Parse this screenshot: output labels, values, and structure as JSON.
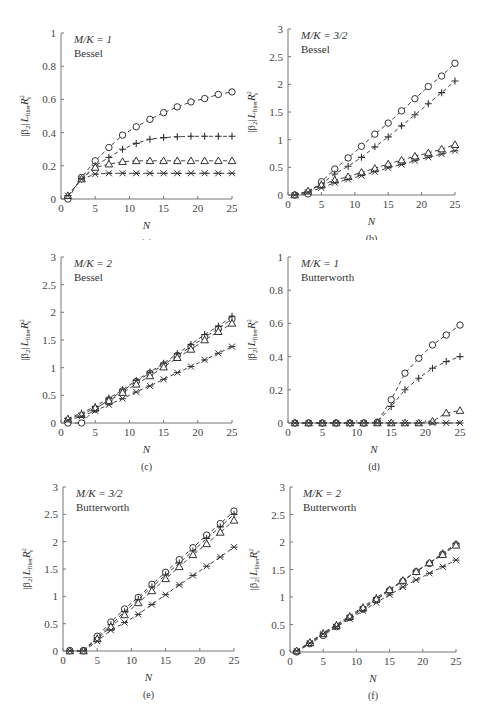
{
  "figure": {
    "ylabel": "|β2| L_fiber R_s^2",
    "xlabel": "N",
    "x_ticks": [
      0,
      5,
      10,
      15,
      20,
      25
    ],
    "series_markers": [
      "circle",
      "plus",
      "triangle",
      "star-x"
    ]
  },
  "chart_data": [
    {
      "id": "a",
      "caption": "(a)",
      "type": "line",
      "title": "M/K = 1",
      "subtitle": "Bessel",
      "xlabel": "N",
      "ylabel": "|β2| L_fiber R_s^2",
      "xlim": [
        0,
        25
      ],
      "ylim": [
        0,
        1
      ],
      "y_ticks": [
        "0",
        "0.2",
        "0.4",
        "0.6",
        "0.8",
        "1"
      ],
      "y_tick_values": [
        0,
        0.2,
        0.4,
        0.6,
        0.8,
        1
      ],
      "grid": false,
      "x": [
        1,
        3,
        5,
        7,
        9,
        11,
        13,
        15,
        17,
        19,
        21,
        23,
        25
      ],
      "series": [
        {
          "name": "circle",
          "marker": "circle",
          "values": [
            0.0,
            0.13,
            0.23,
            0.31,
            0.385,
            0.435,
            0.48,
            0.52,
            0.555,
            0.585,
            0.605,
            0.63,
            0.645
          ]
        },
        {
          "name": "plus",
          "marker": "plus",
          "values": [
            0.02,
            0.12,
            0.2,
            0.25,
            0.3,
            0.335,
            0.36,
            0.37,
            0.375,
            0.378,
            0.378,
            0.378,
            0.378
          ]
        },
        {
          "name": "triangle",
          "marker": "triangle",
          "values": [
            0.02,
            0.12,
            0.19,
            0.21,
            0.225,
            0.23,
            0.23,
            0.23,
            0.23,
            0.23,
            0.23,
            0.23,
            0.23
          ]
        },
        {
          "name": "star",
          "marker": "star",
          "values": [
            0.02,
            0.12,
            0.15,
            0.155,
            0.155,
            0.155,
            0.155,
            0.155,
            0.155,
            0.155,
            0.155,
            0.155,
            0.155
          ]
        }
      ]
    },
    {
      "id": "b",
      "caption": "(b)",
      "type": "line",
      "title": "M/K = 3/2",
      "subtitle": "Bessel",
      "xlabel": "N",
      "ylabel": "|β2| L_fiber R_s^2",
      "xlim": [
        0,
        25
      ],
      "ylim": [
        0,
        3
      ],
      "y_ticks": [
        "0",
        "0.5",
        "1",
        "1.5",
        "2",
        "2.5",
        "3"
      ],
      "y_tick_values": [
        0,
        0.5,
        1,
        1.5,
        2,
        2.5,
        3
      ],
      "grid": false,
      "x": [
        1,
        3,
        5,
        7,
        9,
        11,
        13,
        15,
        17,
        19,
        21,
        23,
        25
      ],
      "series": [
        {
          "name": "circle",
          "marker": "circle",
          "values": [
            0.0,
            0.02,
            0.24,
            0.47,
            0.67,
            0.88,
            1.1,
            1.3,
            1.52,
            1.74,
            1.96,
            2.15,
            2.38
          ]
        },
        {
          "name": "plus",
          "marker": "plus",
          "values": [
            0.0,
            0.07,
            0.2,
            0.38,
            0.52,
            0.68,
            0.87,
            1.05,
            1.25,
            1.45,
            1.65,
            1.85,
            2.06
          ]
        },
        {
          "name": "triangle",
          "marker": "triangle",
          "values": [
            0.0,
            0.07,
            0.18,
            0.27,
            0.33,
            0.41,
            0.48,
            0.56,
            0.63,
            0.7,
            0.76,
            0.83,
            0.91
          ]
        },
        {
          "name": "star",
          "marker": "star",
          "values": [
            0.0,
            0.05,
            0.13,
            0.22,
            0.28,
            0.35,
            0.42,
            0.49,
            0.55,
            0.62,
            0.68,
            0.74,
            0.8
          ]
        }
      ]
    },
    {
      "id": "c",
      "caption": "(c)",
      "type": "line",
      "title": "M/K = 2",
      "subtitle": "Bessel",
      "xlabel": "N",
      "ylabel": "|β2| L_fiber R_s^2",
      "xlim": [
        0,
        25
      ],
      "ylim": [
        0,
        3
      ],
      "y_ticks": [
        "0",
        "0.5",
        "1",
        "1.5",
        "2",
        "2.5",
        "3"
      ],
      "y_tick_values": [
        0,
        0.5,
        1,
        1.5,
        2,
        2.5,
        3
      ],
      "grid": false,
      "x": [
        1,
        3,
        5,
        7,
        9,
        11,
        13,
        15,
        17,
        19,
        21,
        23,
        25
      ],
      "series": [
        {
          "name": "circle",
          "marker": "circle",
          "values": [
            0.0,
            0.0,
            0.25,
            0.42,
            0.58,
            0.75,
            0.9,
            1.05,
            1.22,
            1.38,
            1.55,
            1.7,
            1.88
          ]
        },
        {
          "name": "plus",
          "marker": "plus",
          "values": [
            0.08,
            0.18,
            0.3,
            0.45,
            0.6,
            0.77,
            0.92,
            1.08,
            1.25,
            1.42,
            1.6,
            1.75,
            1.93
          ]
        },
        {
          "name": "triangle",
          "marker": "triangle",
          "values": [
            0.07,
            0.15,
            0.27,
            0.4,
            0.55,
            0.7,
            0.85,
            1.01,
            1.18,
            1.33,
            1.5,
            1.65,
            1.8
          ]
        },
        {
          "name": "star",
          "marker": "star",
          "values": [
            0.05,
            0.12,
            0.22,
            0.33,
            0.44,
            0.56,
            0.67,
            0.79,
            0.91,
            1.02,
            1.14,
            1.26,
            1.38
          ]
        }
      ]
    },
    {
      "id": "d",
      "caption": "(d)",
      "type": "line",
      "title": "M/K = 1",
      "subtitle": "Butterworth",
      "xlabel": "N",
      "ylabel": "|β2| L_fiber R_s^2",
      "xlim": [
        0,
        25
      ],
      "ylim": [
        0,
        1
      ],
      "y_ticks": [
        "0",
        "0.2",
        "0.4",
        "0.6",
        "0.8",
        "1"
      ],
      "y_tick_values": [
        0,
        0.2,
        0.4,
        0.6,
        0.8,
        1
      ],
      "grid": false,
      "x": [
        1,
        3,
        5,
        7,
        9,
        11,
        13,
        15,
        17,
        19,
        21,
        23,
        25
      ],
      "series": [
        {
          "name": "circle",
          "marker": "circle",
          "values": [
            0,
            0,
            0,
            0,
            0,
            0,
            0.005,
            0.14,
            0.3,
            0.39,
            0.47,
            0.53,
            0.59
          ]
        },
        {
          "name": "plus",
          "marker": "plus",
          "values": [
            0,
            0,
            0,
            0,
            0,
            0,
            0.005,
            0.1,
            0.2,
            0.27,
            0.33,
            0.37,
            0.4
          ]
        },
        {
          "name": "triangle",
          "marker": "triangle",
          "values": [
            0,
            0,
            0,
            0,
            0,
            0,
            0,
            0,
            0,
            0,
            0.01,
            0.06,
            0.075
          ]
        },
        {
          "name": "star",
          "marker": "star",
          "values": [
            0,
            0,
            0,
            0,
            0,
            0,
            0,
            0,
            0,
            0,
            0,
            0,
            0
          ]
        }
      ]
    },
    {
      "id": "e",
      "caption": "(e)",
      "type": "line",
      "title": "M/K = 3/2",
      "subtitle": "Butterworth",
      "xlabel": "N",
      "ylabel": "|β2| L_fiber R_s^2",
      "xlim": [
        0,
        25
      ],
      "ylim": [
        0,
        3
      ],
      "y_ticks": [
        "0",
        "0.5",
        "1",
        "1.5",
        "2",
        "2.5",
        "3"
      ],
      "y_tick_values": [
        0,
        0.5,
        1,
        1.5,
        2,
        2.5,
        3
      ],
      "grid": false,
      "x": [
        1,
        3,
        5,
        7,
        9,
        11,
        13,
        15,
        17,
        19,
        21,
        23,
        25
      ],
      "series": [
        {
          "name": "circle",
          "marker": "circle",
          "values": [
            0.01,
            0.01,
            0.27,
            0.53,
            0.77,
            0.98,
            1.22,
            1.44,
            1.67,
            1.89,
            2.12,
            2.33,
            2.56
          ]
        },
        {
          "name": "plus",
          "marker": "plus",
          "values": [
            0.0,
            0.0,
            0.24,
            0.48,
            0.72,
            0.94,
            1.17,
            1.39,
            1.61,
            1.83,
            2.06,
            2.27,
            2.5
          ]
        },
        {
          "name": "triangle",
          "marker": "triangle",
          "values": [
            0.0,
            0.0,
            0.22,
            0.44,
            0.66,
            0.88,
            1.1,
            1.32,
            1.54,
            1.76,
            1.96,
            2.17,
            2.39
          ]
        },
        {
          "name": "star",
          "marker": "star",
          "values": [
            0.0,
            0.0,
            0.18,
            0.38,
            0.52,
            0.67,
            0.85,
            1.03,
            1.21,
            1.38,
            1.55,
            1.72,
            1.9
          ]
        }
      ]
    },
    {
      "id": "f",
      "caption": "(f)",
      "type": "line",
      "title": "M/K = 2",
      "subtitle": "Butterworth",
      "xlabel": "N",
      "ylabel": "|β2| L_fiber R_s^2",
      "xlim": [
        0,
        25
      ],
      "ylim": [
        0,
        3
      ],
      "y_ticks": [
        "0",
        "0.5",
        "1",
        "1.5",
        "2",
        "2.5",
        "3"
      ],
      "y_tick_values": [
        0,
        0.5,
        1,
        1.5,
        2,
        2.5,
        3
      ],
      "grid": false,
      "x": [
        1,
        3,
        5,
        7,
        9,
        11,
        13,
        15,
        17,
        19,
        21,
        23,
        25
      ],
      "series": [
        {
          "name": "circle",
          "marker": "circle",
          "values": [
            0.0,
            0.15,
            0.3,
            0.46,
            0.63,
            0.78,
            0.95,
            1.12,
            1.29,
            1.46,
            1.61,
            1.78,
            1.95
          ]
        },
        {
          "name": "plus",
          "marker": "plus",
          "values": [
            0.02,
            0.18,
            0.35,
            0.5,
            0.66,
            0.82,
            0.99,
            1.14,
            1.3,
            1.47,
            1.62,
            1.8,
            1.97
          ]
        },
        {
          "name": "triangle",
          "marker": "triangle",
          "values": [
            0.02,
            0.17,
            0.33,
            0.48,
            0.64,
            0.8,
            0.96,
            1.13,
            1.3,
            1.46,
            1.62,
            1.77,
            1.94
          ]
        },
        {
          "name": "star",
          "marker": "star",
          "values": [
            0.02,
            0.16,
            0.33,
            0.46,
            0.6,
            0.75,
            0.9,
            1.04,
            1.18,
            1.31,
            1.43,
            1.55,
            1.67
          ]
        }
      ]
    }
  ]
}
